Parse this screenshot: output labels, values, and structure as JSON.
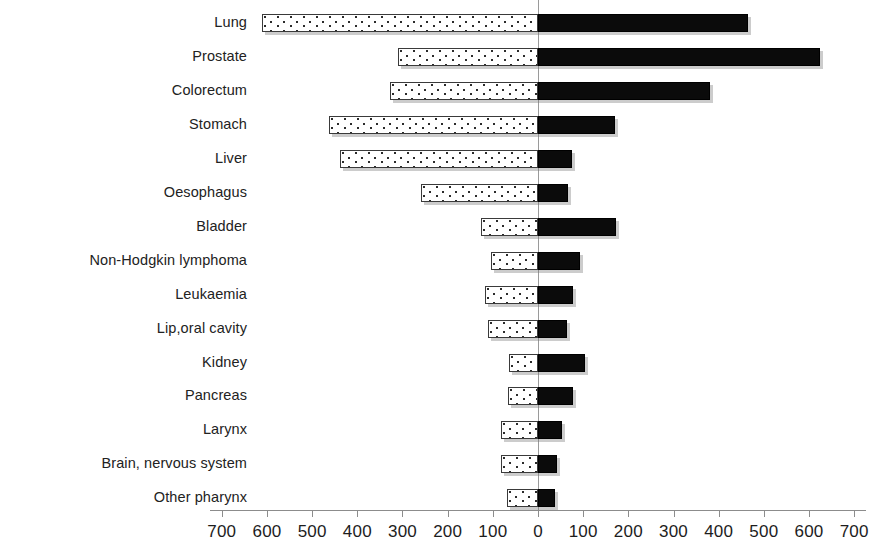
{
  "chart_data": {
    "type": "bar",
    "orientation": "horizontal",
    "style": "bidirectional-pyramid",
    "title": "",
    "xlabel": "",
    "ylabel": "",
    "grid": false,
    "legend": null,
    "xlim": [
      -700,
      700
    ],
    "xticks": [
      700,
      600,
      500,
      400,
      300,
      200,
      100,
      0,
      100,
      200,
      300,
      400,
      500,
      600,
      700
    ],
    "xtick_labels": [
      "700",
      "600",
      "500",
      "400",
      "300",
      "200",
      "100",
      "0",
      "100",
      "200",
      "300",
      "400",
      "500",
      "600",
      "700"
    ],
    "categories": [
      "Lung",
      "Prostate",
      "Colorectum",
      "Stomach",
      "Liver",
      "Oesophagus",
      "Bladder",
      "Non-Hodgkin lymphoma",
      "Leukaemia",
      "Lip,oral cavity",
      "Kidney",
      "Pancreas",
      "Larynx",
      "Brain, nervous system",
      "Other pharynx"
    ],
    "series": [
      {
        "name": "left",
        "side": "left",
        "color": "#ffffff",
        "pattern": "dotted",
        "values": [
          612,
          310,
          327,
          462,
          438,
          259,
          126,
          104,
          117,
          111,
          64,
          66,
          82,
          82,
          69
        ]
      },
      {
        "name": "right",
        "side": "right",
        "color": "#0b0b0b",
        "pattern": "solid",
        "values": [
          465,
          624,
          380,
          170,
          75,
          66,
          173,
          93,
          78,
          64,
          104,
          78,
          53,
          42,
          38
        ]
      }
    ]
  },
  "axis": {
    "zero_color": "#9a9a9a",
    "tick_color": "#8c8c8c"
  }
}
